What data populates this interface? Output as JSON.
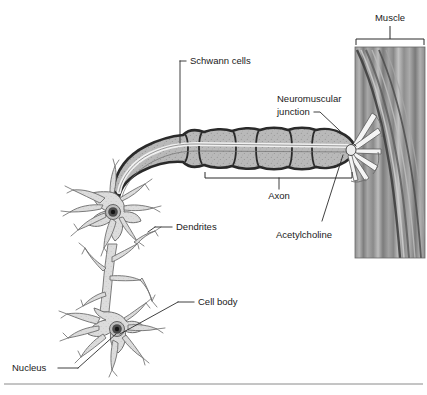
{
  "figure": {
    "background_color": "#ffffff",
    "label_color": "#1a1a1a",
    "leader_line_color": "#2b2b2b",
    "footer_rule_color": "#8a8a8a"
  },
  "labels": {
    "schwann_cells": "Schwann cells",
    "muscle": "Muscle",
    "neuromuscular_junction_line1": "Neuromuscular",
    "neuromuscular_junction_line2": "junction",
    "axon": "Axon",
    "acetylcholine": "Acetylcholine",
    "dendrites": "Dendrites",
    "cell_body": "Cell body",
    "nucleus": "Nucleus"
  },
  "structures": {
    "myelin_fill": "#b9b9b9",
    "myelin_outline": "#2a2a2a",
    "axon_fill": "#dedede",
    "soma_fill": "#d9d9d9",
    "soma_outline": "#6e6e6e",
    "nucleus_fill": "#4a4a4a",
    "nucleolus_fill": "#1c1c1c",
    "muscle_light": "#c9c9c9",
    "muscle_mid": "#9a9a9a",
    "muscle_dark": "#6d6d6d",
    "terminal_branch_fill": "#f2f2f2"
  },
  "parts": [
    {
      "name": "schwann-cells",
      "label": "Schwann cells"
    },
    {
      "name": "axon",
      "label": "Axon"
    },
    {
      "name": "neuromuscular-junction",
      "label": "Neuromuscular junction"
    },
    {
      "name": "acetylcholine",
      "label": "Acetylcholine"
    },
    {
      "name": "muscle",
      "label": "Muscle"
    },
    {
      "name": "dendrites",
      "label": "Dendrites"
    },
    {
      "name": "cell-body",
      "label": "Cell body"
    },
    {
      "name": "nucleus",
      "label": "Nucleus"
    }
  ]
}
